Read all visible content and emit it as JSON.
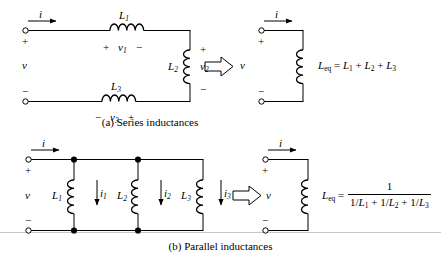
{
  "figure": {
    "captions": {
      "a": "(a) Series inductances",
      "b": "(b) Parallel inductances"
    }
  },
  "series_circuit": {
    "source_labels": {
      "current": "i",
      "voltage": "v",
      "plus": "+",
      "minus": "−"
    },
    "inductors": [
      {
        "name": "L1",
        "label": "L",
        "sub": "1",
        "voltage_label": "v",
        "voltage_sub": "1",
        "polarity_left": "+",
        "polarity_right": "−",
        "orientation": "horizontal"
      },
      {
        "name": "L2",
        "label": "L",
        "sub": "2",
        "voltage_label": "v",
        "voltage_sub": "2",
        "polarity_top": "+",
        "polarity_bottom": "−",
        "orientation": "vertical"
      },
      {
        "name": "L3",
        "label": "L",
        "sub": "3",
        "voltage_label": "v",
        "voltage_sub": "3",
        "polarity_left": "−",
        "polarity_right": "+",
        "orientation": "horizontal"
      }
    ]
  },
  "series_equivalent": {
    "current": "i",
    "voltage": "v",
    "plus": "+",
    "minus": "−",
    "equation": {
      "lhs": "L",
      "lhs_sub": "eq",
      "equals": "=",
      "terms": [
        {
          "label": "L",
          "sub": "1"
        },
        {
          "label": "L",
          "sub": "2"
        },
        {
          "label": "L",
          "sub": "3"
        }
      ],
      "operator": "+",
      "full_text": "L_eq = L_1 + L_2 + L_3"
    }
  },
  "parallel_circuit": {
    "source_labels": {
      "current": "i",
      "voltage": "v",
      "plus": "+",
      "minus": "−"
    },
    "branches": [
      {
        "name": "L1",
        "label": "L",
        "sub": "1",
        "branch_current": "i",
        "branch_current_sub": "1"
      },
      {
        "name": "L2",
        "label": "L",
        "sub": "2",
        "branch_current": "i",
        "branch_current_sub": "2"
      },
      {
        "name": "L3",
        "label": "L",
        "sub": "3",
        "branch_current": "i",
        "branch_current_sub": "3"
      }
    ]
  },
  "parallel_equivalent": {
    "current": "i",
    "voltage": "v",
    "plus": "+",
    "minus": "−",
    "equation": {
      "lhs": "L",
      "lhs_sub": "eq",
      "equals": "=",
      "numerator": "1",
      "denominator_terms": [
        {
          "prefix": "1/",
          "label": "L",
          "sub": "1"
        },
        {
          "prefix": "1/",
          "label": "L",
          "sub": "2"
        },
        {
          "prefix": "1/",
          "label": "L",
          "sub": "3"
        }
      ],
      "operator": "+",
      "full_text": "L_eq = 1 / (1/L_1 + 1/L_2 + 1/L_3)"
    }
  },
  "style": {
    "wire_color": "#000000",
    "background": "#ffffff",
    "arrow_fill": "#ffffff"
  }
}
